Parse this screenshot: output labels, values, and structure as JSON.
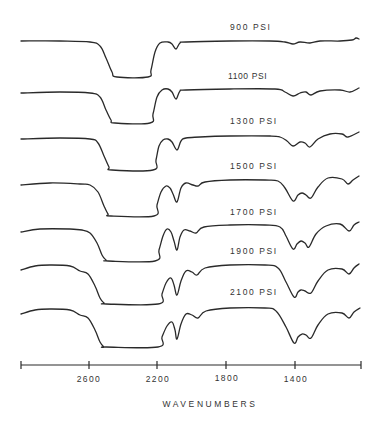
{
  "chart_data": {
    "type": "line",
    "title": "",
    "xlabel": "WAVENUMBERS",
    "ylabel": "",
    "x_axis": {
      "range": [
        3000,
        1000
      ],
      "reversed": true,
      "ticks": [
        2600,
        2200,
        1800,
        1400
      ],
      "tick_labels": [
        "2600",
        "2200",
        "1800",
        "1400"
      ],
      "grid": false
    },
    "layout": "stacked offset spectra (transmittance), no y-axis scale",
    "series": [
      {
        "name": "900 PSI",
        "label_pos": [
          230,
          24
        ],
        "points": [
          [
            21,
            41
          ],
          [
            60,
            41
          ],
          [
            90,
            42
          ],
          [
            100,
            46
          ],
          [
            106,
            58
          ],
          [
            112,
            72
          ],
          [
            117,
            77
          ],
          [
            148,
            77
          ],
          [
            151,
            70
          ],
          [
            155,
            52
          ],
          [
            160,
            43
          ],
          [
            168,
            42
          ],
          [
            172,
            44
          ],
          [
            176,
            49
          ],
          [
            180,
            43
          ],
          [
            186,
            42
          ],
          [
            230,
            41
          ],
          [
            270,
            41
          ],
          [
            285,
            42
          ],
          [
            293,
            44
          ],
          [
            300,
            42
          ],
          [
            310,
            43
          ],
          [
            320,
            41
          ],
          [
            340,
            41
          ],
          [
            352,
            40
          ],
          [
            356,
            38
          ],
          [
            359,
            39
          ]
        ]
      },
      {
        "name": "1100 PSI",
        "label_pos": [
          230,
          72
        ],
        "points": [
          [
            21,
            93
          ],
          [
            60,
            92
          ],
          [
            90,
            93
          ],
          [
            100,
            97
          ],
          [
            106,
            110
          ],
          [
            111,
            120
          ],
          [
            115,
            123
          ],
          [
            150,
            123
          ],
          [
            153,
            114
          ],
          [
            157,
            97
          ],
          [
            162,
            90
          ],
          [
            168,
            89
          ],
          [
            172,
            92
          ],
          [
            176,
            99
          ],
          [
            180,
            91
          ],
          [
            186,
            90
          ],
          [
            230,
            89
          ],
          [
            275,
            89
          ],
          [
            285,
            92
          ],
          [
            293,
            96
          ],
          [
            300,
            93
          ],
          [
            306,
            92
          ],
          [
            311,
            95
          ],
          [
            320,
            91
          ],
          [
            340,
            90
          ],
          [
            350,
            92
          ],
          [
            359,
            88
          ]
        ]
      },
      {
        "name": "1300 PSI",
        "label_pos": [
          230,
          117
        ],
        "points": [
          [
            21,
            139
          ],
          [
            60,
            138
          ],
          [
            90,
            139
          ],
          [
            98,
            143
          ],
          [
            104,
            156
          ],
          [
            109,
            167
          ],
          [
            112,
            170
          ],
          [
            153,
            170
          ],
          [
            156,
            160
          ],
          [
            159,
            146
          ],
          [
            163,
            140
          ],
          [
            168,
            139
          ],
          [
            172,
            142
          ],
          [
            177,
            150
          ],
          [
            181,
            141
          ],
          [
            186,
            138
          ],
          [
            200,
            137
          ],
          [
            230,
            136
          ],
          [
            270,
            136
          ],
          [
            280,
            137
          ],
          [
            287,
            141
          ],
          [
            293,
            146
          ],
          [
            300,
            142
          ],
          [
            305,
            143
          ],
          [
            310,
            147
          ],
          [
            318,
            139
          ],
          [
            330,
            134
          ],
          [
            342,
            134
          ],
          [
            348,
            137
          ],
          [
            359,
            132
          ]
        ]
      },
      {
        "name": "1500 PSI",
        "label_pos": [
          230,
          162
        ],
        "points": [
          [
            21,
            185
          ],
          [
            50,
            183
          ],
          [
            80,
            184
          ],
          [
            90,
            185
          ],
          [
            98,
            192
          ],
          [
            104,
            206
          ],
          [
            108,
            214
          ],
          [
            111,
            216
          ],
          [
            154,
            216
          ],
          [
            157,
            205
          ],
          [
            161,
            192
          ],
          [
            166,
            186
          ],
          [
            170,
            188
          ],
          [
            173,
            194
          ],
          [
            177,
            202
          ],
          [
            181,
            188
          ],
          [
            186,
            183
          ],
          [
            193,
            185
          ],
          [
            198,
            186
          ],
          [
            205,
            182
          ],
          [
            230,
            180
          ],
          [
            265,
            180
          ],
          [
            278,
            181
          ],
          [
            285,
            188
          ],
          [
            293,
            201
          ],
          [
            298,
            195
          ],
          [
            302,
            193
          ],
          [
            306,
            195
          ],
          [
            311,
            198
          ],
          [
            318,
            187
          ],
          [
            328,
            178
          ],
          [
            342,
            179
          ],
          [
            348,
            184
          ],
          [
            353,
            180
          ],
          [
            359,
            176
          ]
        ]
      },
      {
        "name": "1700 PSI",
        "label_pos": [
          230,
          208
        ],
        "points": [
          [
            21,
            232
          ],
          [
            40,
            229
          ],
          [
            70,
            229
          ],
          [
            82,
            230
          ],
          [
            90,
            233
          ],
          [
            97,
            243
          ],
          [
            102,
            255
          ],
          [
            106,
            260
          ],
          [
            108,
            261
          ],
          [
            155,
            261
          ],
          [
            159,
            250
          ],
          [
            163,
            236
          ],
          [
            167,
            229
          ],
          [
            171,
            232
          ],
          [
            174,
            241
          ],
          [
            177,
            250
          ],
          [
            180,
            237
          ],
          [
            184,
            230
          ],
          [
            190,
            231
          ],
          [
            196,
            233
          ],
          [
            204,
            227
          ],
          [
            230,
            225
          ],
          [
            265,
            225
          ],
          [
            280,
            227
          ],
          [
            286,
            236
          ],
          [
            293,
            249
          ],
          [
            297,
            244
          ],
          [
            301,
            241
          ],
          [
            305,
            243
          ],
          [
            309,
            247
          ],
          [
            316,
            234
          ],
          [
            326,
            226
          ],
          [
            340,
            224
          ],
          [
            349,
            231
          ],
          [
            354,
            225
          ],
          [
            359,
            222
          ]
        ]
      },
      {
        "name": "1900 PSI",
        "label_pos": [
          230,
          247
        ],
        "points": [
          [
            21,
            270
          ],
          [
            35,
            266
          ],
          [
            50,
            265
          ],
          [
            70,
            266
          ],
          [
            80,
            271
          ],
          [
            88,
            274
          ],
          [
            95,
            286
          ],
          [
            100,
            298
          ],
          [
            104,
            303
          ],
          [
            106,
            304
          ],
          [
            158,
            304
          ],
          [
            162,
            294
          ],
          [
            166,
            283
          ],
          [
            171,
            278
          ],
          [
            174,
            285
          ],
          [
            177,
            295
          ],
          [
            181,
            281
          ],
          [
            186,
            271
          ],
          [
            192,
            272
          ],
          [
            197,
            275
          ],
          [
            205,
            268
          ],
          [
            230,
            265
          ],
          [
            265,
            265
          ],
          [
            278,
            268
          ],
          [
            286,
            282
          ],
          [
            294,
            297
          ],
          [
            298,
            292
          ],
          [
            301,
            290
          ],
          [
            305,
            291
          ],
          [
            311,
            293
          ],
          [
            318,
            281
          ],
          [
            328,
            270
          ],
          [
            342,
            269
          ],
          [
            349,
            274
          ],
          [
            354,
            268
          ],
          [
            359,
            264
          ]
        ]
      },
      {
        "name": "2100 PSI",
        "label_pos": [
          230,
          288
        ],
        "points": [
          [
            21,
            314
          ],
          [
            35,
            310
          ],
          [
            50,
            309
          ],
          [
            70,
            310
          ],
          [
            80,
            315
          ],
          [
            88,
            318
          ],
          [
            95,
            330
          ],
          [
            100,
            342
          ],
          [
            104,
            347
          ],
          [
            106,
            347
          ],
          [
            158,
            347
          ],
          [
            162,
            337
          ],
          [
            167,
            326
          ],
          [
            172,
            322
          ],
          [
            175,
            330
          ],
          [
            177,
            339
          ],
          [
            181,
            324
          ],
          [
            186,
            314
          ],
          [
            192,
            315
          ],
          [
            198,
            318
          ],
          [
            206,
            311
          ],
          [
            230,
            308
          ],
          [
            265,
            308
          ],
          [
            276,
            311
          ],
          [
            286,
            327
          ],
          [
            294,
            343
          ],
          [
            298,
            337
          ],
          [
            302,
            334
          ],
          [
            306,
            335
          ],
          [
            311,
            338
          ],
          [
            318,
            325
          ],
          [
            328,
            314
          ],
          [
            342,
            313
          ],
          [
            349,
            318
          ],
          [
            354,
            312
          ],
          [
            360,
            308
          ]
        ]
      }
    ]
  },
  "axis": {
    "x_start": 21,
    "x_end": 361,
    "y": 365,
    "ticks_px": [
      89,
      157,
      226,
      295
    ],
    "tick_labels": [
      "2600",
      "2200",
      "1800",
      "1400"
    ]
  },
  "labels": {
    "s0": "900 PSI",
    "s1": "1100 PSI",
    "s2": "1300 PSI",
    "s3": "1500 PSI",
    "s4": "1700 PSI",
    "s5": "1900 PSI",
    "s6": "2100 PSI",
    "xlabel": "WAVENUMBERS",
    "t0": "2600",
    "t1": "2200",
    "t2": "1800",
    "t3": "1400"
  },
  "colors": {
    "ink": "#2a2a2a",
    "background": "#ffffff"
  }
}
